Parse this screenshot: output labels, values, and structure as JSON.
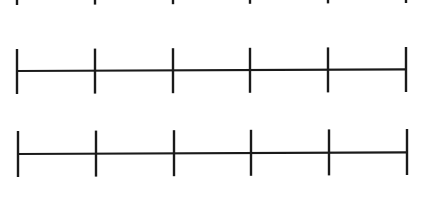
{
  "worksheet": {
    "description": "Blank number lines with evenly spaced tick marks",
    "stroke_color": "#1a1a1a",
    "background_color": "#ffffff",
    "tick_count": 6,
    "number_lines": [
      {
        "id": "number-line-1",
        "partially_visible": true,
        "show_baseline": false,
        "y_baseline": -13,
        "x_start": 17,
        "x_end": 406,
        "tick_top": -35,
        "tick_bottom": 5,
        "ticks_x": [
          17,
          95,
          173,
          250,
          328,
          406
        ],
        "labels": []
      },
      {
        "id": "number-line-2",
        "partially_visible": false,
        "show_baseline": true,
        "y_baseline": 71,
        "x_start": 17,
        "x_end": 406,
        "tick_top": 49,
        "tick_bottom": 94,
        "ticks_x": [
          17,
          95,
          173,
          250,
          328,
          406
        ],
        "labels": []
      },
      {
        "id": "number-line-3",
        "partially_visible": false,
        "show_baseline": true,
        "y_baseline": 154,
        "x_start": 18,
        "x_end": 407,
        "tick_top": 131,
        "tick_bottom": 177,
        "ticks_x": [
          18,
          96,
          174,
          251,
          329,
          407
        ],
        "labels": []
      }
    ]
  }
}
